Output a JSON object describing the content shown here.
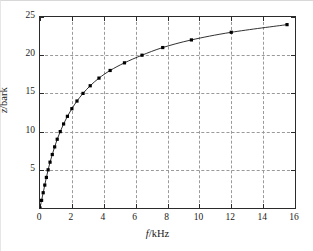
{
  "figure": {
    "background_color": "#ffffff",
    "axes_color": "#2b2b2b",
    "grid_color": "#9a9a9a",
    "curve_color": "#1a1a1a",
    "marker_color": "#000000"
  },
  "axis": {
    "x_title_symbol": "f",
    "x_title_unit": "/kHz",
    "y_title_symbol": "z",
    "y_title_unit": "/bark",
    "x_ticks": [
      "0",
      "2",
      "4",
      "6",
      "8",
      "10",
      "12",
      "14",
      "16"
    ],
    "y_ticks": [
      "5",
      "10",
      "15",
      "20",
      "25"
    ]
  },
  "chart_data": {
    "type": "line",
    "title": "",
    "subtitle": "",
    "xlabel": "f/kHz",
    "ylabel": "z/bark",
    "xlim": [
      0,
      16
    ],
    "ylim": [
      0,
      25
    ],
    "xticks": [
      0,
      2,
      4,
      6,
      8,
      10,
      12,
      14,
      16
    ],
    "yticks": [
      5,
      10,
      15,
      20,
      25
    ],
    "grid": true,
    "legend": null,
    "legend_position": "none",
    "marker": "filled-square",
    "annotations": [],
    "series": [
      {
        "name": "critical band rate (Bark scale)",
        "x": [
          0,
          0.1,
          0.2,
          0.3,
          0.4,
          0.51,
          0.63,
          0.77,
          0.92,
          1.08,
          1.27,
          1.48,
          1.72,
          2.0,
          2.32,
          2.7,
          3.15,
          3.7,
          4.4,
          5.3,
          6.4,
          7.7,
          9.5,
          12.0,
          15.5
        ],
        "y": [
          0,
          1,
          2,
          3,
          4,
          5,
          6,
          7,
          8,
          9,
          10,
          11,
          12,
          13,
          14,
          15,
          16,
          17,
          18,
          19,
          20,
          21,
          22,
          23,
          24
        ]
      }
    ]
  }
}
